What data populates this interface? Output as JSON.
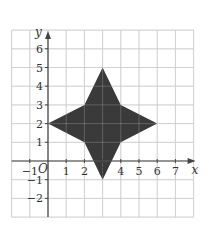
{
  "chart_data": {
    "type": "polygon",
    "title": "",
    "xlabel": "x",
    "ylabel": "y",
    "origin_label": "O",
    "xlim": [
      -2,
      8
    ],
    "ylim": [
      -3,
      7
    ],
    "grid": true,
    "x_ticks": [
      -1,
      1,
      2,
      3,
      4,
      5,
      6,
      7
    ],
    "x_tick_labels": [
      "−1",
      "1",
      "2",
      "3",
      "4",
      "5",
      "6",
      "7"
    ],
    "y_ticks": [
      6,
      5,
      4,
      3,
      2,
      1,
      -1,
      -2
    ],
    "y_tick_labels": [
      "6",
      "5",
      "4",
      "3",
      "2",
      "1",
      "−1",
      "−2"
    ],
    "shape": {
      "name": "four-pointed star",
      "fill": "#3a3a3a",
      "vertices": [
        [
          0,
          2
        ],
        [
          2,
          3
        ],
        [
          3,
          5
        ],
        [
          4,
          3
        ],
        [
          6,
          2
        ],
        [
          4,
          1
        ],
        [
          3,
          -1
        ],
        [
          2,
          1
        ]
      ]
    },
    "colors": {
      "grid": "#d4d4d4",
      "axis": "#444444",
      "shape": "#3a3a3a"
    }
  }
}
